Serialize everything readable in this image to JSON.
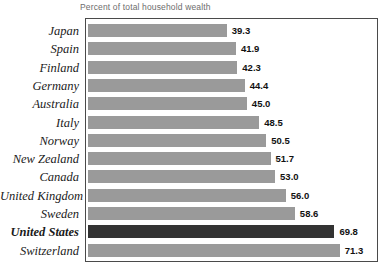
{
  "chart_data": {
    "type": "bar",
    "orientation": "horizontal",
    "title": "Percent of total household wealth",
    "xlabel": "",
    "ylabel": "",
    "xlim": [
      0,
      83
    ],
    "grid": false,
    "legend": null,
    "highlight_category": "United States",
    "colors": {
      "bar": "#9a9a9a",
      "bar_highlight": "#333333",
      "border": "#4a4a4a",
      "title_text": "#6d6d6d",
      "label_text": "#1a1a1a",
      "value_text": "#111111",
      "background": "#ffffff"
    },
    "categories": [
      "Japan",
      "Spain",
      "Finland",
      "Germany",
      "Australia",
      "Italy",
      "Norway",
      "New Zealand",
      "Canada",
      "United Kingdom",
      "Sweden",
      "United States",
      "Switzerland"
    ],
    "values": [
      39.3,
      41.9,
      42.3,
      44.4,
      45.0,
      48.5,
      50.5,
      51.7,
      53.0,
      56.0,
      58.6,
      69.8,
      71.3
    ],
    "value_labels": [
      "39.3",
      "41.9",
      "42.3",
      "44.4",
      "45.0",
      "48.5",
      "50.5",
      "51.7",
      "53.0",
      "56.0",
      "58.6",
      "69.8",
      "71.3"
    ],
    "rows": [
      {
        "label": "Japan",
        "value": 39.3,
        "value_label": "39.3",
        "highlight": false
      },
      {
        "label": "Spain",
        "value": 41.9,
        "value_label": "41.9",
        "highlight": false
      },
      {
        "label": "Finland",
        "value": 42.3,
        "value_label": "42.3",
        "highlight": false
      },
      {
        "label": "Germany",
        "value": 44.4,
        "value_label": "44.4",
        "highlight": false
      },
      {
        "label": "Australia",
        "value": 45.0,
        "value_label": "45.0",
        "highlight": false
      },
      {
        "label": "Italy",
        "value": 48.5,
        "value_label": "48.5",
        "highlight": false
      },
      {
        "label": "Norway",
        "value": 50.5,
        "value_label": "50.5",
        "highlight": false
      },
      {
        "label": "New Zealand",
        "value": 51.7,
        "value_label": "51.7",
        "highlight": false
      },
      {
        "label": "Canada",
        "value": 53.0,
        "value_label": "53.0",
        "highlight": false
      },
      {
        "label": "United Kingdom",
        "value": 56.0,
        "value_label": "56.0",
        "highlight": false
      },
      {
        "label": "Sweden",
        "value": 58.6,
        "value_label": "58.6",
        "highlight": false
      },
      {
        "label": "United States",
        "value": 69.8,
        "value_label": "69.8",
        "highlight": true
      },
      {
        "label": "Switzerland",
        "value": 71.3,
        "value_label": "71.3",
        "highlight": false
      }
    ]
  }
}
